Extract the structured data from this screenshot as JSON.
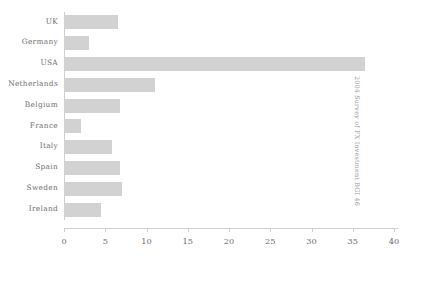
{
  "chart_data": {
    "type": "bar",
    "orientation": "horizontal",
    "title": "",
    "xlabel": "",
    "ylabel": "",
    "categories": [
      "UK",
      "Germany",
      "USA",
      "Netherlands",
      "Belgium",
      "France",
      "Italy",
      "Spain",
      "Sweden",
      "Ireland"
    ],
    "values": [
      6.5,
      3,
      36.5,
      11,
      6.8,
      2,
      5.8,
      6.8,
      7,
      4.5
    ],
    "xticks": [
      0,
      5,
      10,
      15,
      20,
      25,
      30,
      35,
      40
    ],
    "xtick_labels": [
      "0",
      "5",
      "10",
      "15",
      "20",
      "25",
      "30",
      "35",
      "40"
    ],
    "xlim": [
      0,
      40
    ],
    "grid": false,
    "legend": "none",
    "bar_color": "#d2d2d2",
    "axis_color": "#cfcfcf",
    "text_color": "#6d6d6d"
  },
  "side_caption": "2004 Survey of FX Investment BGI 46"
}
